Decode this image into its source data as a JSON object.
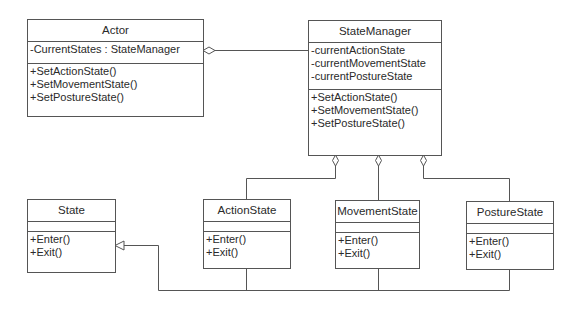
{
  "diagram": {
    "type": "UML class diagram",
    "classes": {
      "actor": {
        "name": "Actor",
        "attributes": [
          "-CurrentStates : StateManager"
        ],
        "operations": [
          "+SetActionState()",
          "+SetMovementState()",
          "+SetPostureState()"
        ]
      },
      "state_manager": {
        "name": "StateManager",
        "attributes": [
          "-currentActionState",
          "-currentMovementState",
          "-currentPostureState"
        ],
        "operations": [
          "+SetActionState()",
          "+SetMovementState()",
          "+SetPostureState()"
        ]
      },
      "state": {
        "name": "State",
        "attributes": [],
        "operations": [
          "+Enter()",
          "+Exit()"
        ]
      },
      "action_state": {
        "name": "ActionState",
        "attributes": [],
        "operations": [
          "+Enter()",
          "+Exit()"
        ]
      },
      "movement_state": {
        "name": "MovementState",
        "attributes": [],
        "operations": [
          "+Enter()",
          "+Exit()"
        ]
      },
      "posture_state": {
        "name": "PostureState",
        "attributes": [],
        "operations": [
          "+Enter()",
          "+Exit()"
        ]
      }
    },
    "relationships": [
      {
        "type": "aggregation",
        "whole": "Actor",
        "part": "StateManager"
      },
      {
        "type": "aggregation",
        "whole": "StateManager",
        "part": "ActionState"
      },
      {
        "type": "aggregation",
        "whole": "StateManager",
        "part": "MovementState"
      },
      {
        "type": "aggregation",
        "whole": "StateManager",
        "part": "PostureState"
      },
      {
        "type": "generalization",
        "child": "ActionState",
        "parent": "State"
      },
      {
        "type": "generalization",
        "child": "MovementState",
        "parent": "State"
      },
      {
        "type": "generalization",
        "child": "PostureState",
        "parent": "State"
      }
    ],
    "colors": {
      "line": "#555555",
      "text": "#2a2a2a",
      "background": "#ffffff"
    }
  }
}
